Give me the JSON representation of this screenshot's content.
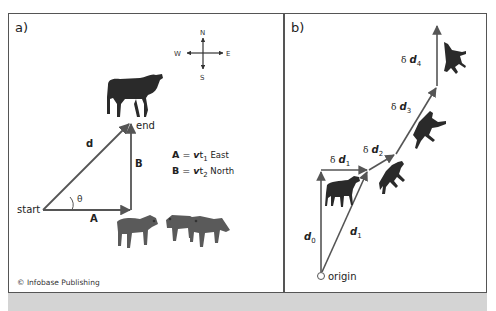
{
  "figure": {
    "panel_a": {
      "label": "a)",
      "compass": {
        "north": "N",
        "south": "S",
        "east": "E",
        "west": "W"
      },
      "points": {
        "start": "start",
        "end": "end"
      },
      "vectors": {
        "d": "d",
        "A": "A",
        "B": "B"
      },
      "angle": "θ",
      "equations": [
        {
          "lhs": "A",
          "eq": " = ",
          "v": "v",
          "t": "t",
          "sub": "1",
          "dir": " East"
        },
        {
          "lhs": "B",
          "eq": " = ",
          "v": "v",
          "t": "t",
          "sub": "2",
          "dir": " North"
        }
      ],
      "credit": "© Infobase Publishing"
    },
    "panel_b": {
      "label": "b)",
      "origin": "origin",
      "delta": "δ",
      "vectors": [
        {
          "name": "d",
          "sub": "0"
        },
        {
          "name": "d",
          "sub": "1"
        }
      ],
      "increments": [
        {
          "name": "d",
          "sub": "1"
        },
        {
          "name": "d",
          "sub": "2"
        },
        {
          "name": "d",
          "sub": "3"
        },
        {
          "name": "d",
          "sub": "4"
        }
      ]
    },
    "colors": {
      "arrow": "#555555",
      "border": "#555555",
      "animal": "#2a2a2a",
      "caption_strip": "#d4d4d4"
    }
  }
}
